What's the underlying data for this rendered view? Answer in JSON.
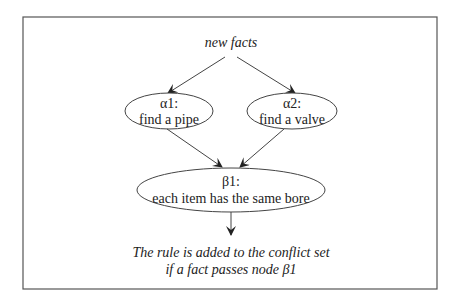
{
  "diagram": {
    "type": "rete-network",
    "input_label": "new facts",
    "nodes": [
      {
        "id": "alpha1",
        "title": "α1:",
        "description": "find a pipe"
      },
      {
        "id": "alpha2",
        "title": "α2:",
        "description": "find a valve"
      },
      {
        "id": "beta1",
        "title": "β1:",
        "description": "each item has the same bore"
      }
    ],
    "edges": [
      {
        "from": "new facts",
        "to": "alpha1"
      },
      {
        "from": "new facts",
        "to": "alpha2"
      },
      {
        "from": "alpha1",
        "to": "beta1"
      },
      {
        "from": "alpha2",
        "to": "beta1"
      },
      {
        "from": "beta1",
        "to": "output"
      }
    ],
    "output_text": {
      "line1": "The rule is added to the conflict set",
      "line2": "if a fact passes node β1"
    }
  },
  "colors": {
    "border": "#555555",
    "stroke": "#444444",
    "text": "#222222",
    "background": "#ffffff"
  }
}
